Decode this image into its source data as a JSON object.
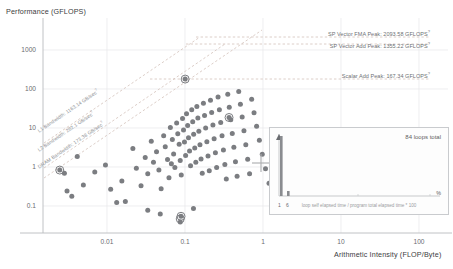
{
  "axes": {
    "y_title": "Performance (GFLOPS)",
    "x_title": "Arithmetic Intensity (FLOP/Byte)",
    "y_ticks": [
      "1000",
      "100",
      "10",
      "1",
      "0.1"
    ],
    "x_ticks": [
      "0.01",
      "0.1",
      "1",
      "10",
      "100"
    ]
  },
  "rooflines": {
    "peaks": [
      {
        "label": "SP Vector FMA Peak: 2093.58 GFLOPS",
        "value": 2093.58,
        "unit": "GFLOPS",
        "sup": "?"
      },
      {
        "label": "SP Vector Add Peak: 1355.22 GFLOPS",
        "value": 1355.22,
        "unit": "GFLOPS",
        "sup": "?"
      },
      {
        "label": "Scalar Add Peak: 167.34 GFLOPS",
        "value": 167.34,
        "unit": "GFLOPS",
        "sup": "?"
      }
    ],
    "bandwidths": [
      {
        "label": "L1 Bandwidth: 1163.14 GB/sec",
        "value": 1163.14,
        "unit": "GB/sec",
        "sup": "?"
      },
      {
        "label": "L2 Bandwidth: 282.1 GB/sec",
        "value": 282.1,
        "unit": "GB/sec",
        "sup": "?"
      },
      {
        "label": "DRAM Bandwidth: 173.38 GB/sec",
        "value": 173.38,
        "unit": "GB/sec",
        "sup": "?"
      }
    ]
  },
  "inset": {
    "title": "84 loops total",
    "caption": "loop self elapsed time / program total elapsed time * 100",
    "tick_left": "1",
    "tick_right": "6",
    "pct_symbol": "%"
  },
  "cursor": {
    "marker": "crosshair"
  },
  "colors": {
    "dot": "#7b7d81",
    "dot_highlight": "#5a5c60",
    "roofline": "#c9b8b0",
    "grid": "#e4e5e7",
    "axis": "#b9bbbe",
    "text": "#55575b"
  },
  "chart_data": {
    "type": "scatter",
    "title": "",
    "xlabel": "Arithmetic Intensity (FLOP/Byte)",
    "ylabel": "Performance (GFLOPS)",
    "xscale": "log",
    "yscale": "log",
    "xlim": [
      0.004,
      160
    ],
    "ylim": [
      0.03,
      4000
    ],
    "grid": true,
    "legend": "none",
    "roof_lines": [
      {
        "name": "SP Vector FMA Peak",
        "type": "horizontal",
        "y": 2093.58
      },
      {
        "name": "SP Vector Add Peak",
        "type": "horizontal",
        "y": 1355.22
      },
      {
        "name": "Scalar Add Peak",
        "type": "horizontal",
        "y": 167.34
      },
      {
        "name": "L1 Bandwidth",
        "type": "slope",
        "bandwidth": 1163.14
      },
      {
        "name": "L2 Bandwidth",
        "type": "slope",
        "bandwidth": 282.1
      },
      {
        "name": "DRAM Bandwidth",
        "type": "slope",
        "bandwidth": 173.38
      }
    ],
    "points": [
      [
        0.0062,
        0.95
      ],
      [
        0.0075,
        0.3
      ],
      [
        0.0098,
        2.0
      ],
      [
        0.0115,
        0.42
      ],
      [
        0.0155,
        0.85
      ],
      [
        0.0205,
        1.25
      ],
      [
        0.0235,
        0.33
      ],
      [
        0.0275,
        0.16
      ],
      [
        0.0315,
        0.52
      ],
      [
        0.0345,
        0.17
      ],
      [
        0.042,
        3.1
      ],
      [
        0.046,
        1.05
      ],
      [
        0.052,
        0.4
      ],
      [
        0.058,
        1.9
      ],
      [
        0.062,
        0.78
      ],
      [
        0.068,
        4.6
      ],
      [
        0.072,
        1.45
      ],
      [
        0.078,
        2.6
      ],
      [
        0.083,
        0.95
      ],
      [
        0.088,
        0.34
      ],
      [
        0.094,
        6.2
      ],
      [
        0.098,
        3.4
      ],
      [
        0.104,
        1.7
      ],
      [
        0.108,
        0.62
      ],
      [
        0.112,
        9.8
      ],
      [
        0.118,
        5.1
      ],
      [
        0.122,
        2.3
      ],
      [
        0.126,
        1.1
      ],
      [
        0.132,
        12.5
      ],
      [
        0.136,
        7.0
      ],
      [
        0.141,
        3.9
      ],
      [
        0.145,
        1.6
      ],
      [
        0.149,
        0.72
      ],
      [
        0.154,
        16.0
      ],
      [
        0.158,
        8.6
      ],
      [
        0.162,
        4.4
      ],
      [
        0.167,
        2.1
      ],
      [
        0.171,
        21.0
      ],
      [
        0.176,
        11.0
      ],
      [
        0.18,
        5.6
      ],
      [
        0.185,
        2.7
      ],
      [
        0.19,
        1.2
      ],
      [
        0.196,
        26.0
      ],
      [
        0.201,
        13.5
      ],
      [
        0.206,
        6.8
      ],
      [
        0.212,
        3.2
      ],
      [
        0.218,
        1.45
      ],
      [
        0.224,
        31.0
      ],
      [
        0.23,
        16.5
      ],
      [
        0.236,
        8.0
      ],
      [
        0.243,
        3.8
      ],
      [
        0.25,
        1.75
      ],
      [
        0.258,
        0.8
      ],
      [
        0.266,
        37.0
      ],
      [
        0.274,
        19.0
      ],
      [
        0.282,
        9.5
      ],
      [
        0.291,
        4.5
      ],
      [
        0.3,
        2.05
      ],
      [
        0.31,
        0.92
      ],
      [
        0.32,
        44.0
      ],
      [
        0.33,
        22.5
      ],
      [
        0.341,
        11.2
      ],
      [
        0.352,
        5.3
      ],
      [
        0.364,
        2.45
      ],
      [
        0.376,
        1.1
      ],
      [
        0.39,
        52.0
      ],
      [
        0.404,
        26.0
      ],
      [
        0.418,
        13.0
      ],
      [
        0.433,
        6.2
      ],
      [
        0.449,
        2.85
      ],
      [
        0.466,
        1.28
      ],
      [
        0.484,
        0.58
      ],
      [
        0.503,
        61.0
      ],
      [
        0.523,
        30.0
      ],
      [
        0.544,
        15.0
      ],
      [
        0.566,
        7.1
      ],
      [
        0.59,
        3.3
      ],
      [
        0.615,
        1.5
      ],
      [
        0.642,
        0.68
      ],
      [
        0.67,
        71.0
      ],
      [
        0.7,
        35.0
      ],
      [
        0.733,
        17.5
      ],
      [
        0.768,
        8.2
      ],
      [
        0.806,
        3.8
      ],
      [
        0.847,
        1.72
      ],
      [
        0.89,
        0.78
      ],
      [
        0.94,
        46.0
      ],
      [
        1.0,
        22.0
      ],
      [
        1.07,
        10.5
      ],
      [
        1.15,
        4.9
      ],
      [
        1.24,
        2.25
      ],
      [
        1.35,
        1.02
      ],
      [
        1.48,
        0.46
      ],
      [
        1.65,
        0.21
      ],
      [
        2.1,
        0.33
      ],
      [
        0.165,
        140.0
      ],
      [
        0.52,
        17.0
      ],
      [
        0.115,
        1.35
      ],
      [
        0.145,
        0.055
      ],
      [
        0.148,
        0.075
      ],
      [
        0.007,
        0.8
      ],
      [
        0.0085,
        0.225
      ],
      [
        0.062,
        0.105
      ],
      [
        0.086,
        0.085
      ],
      [
        0.205,
        0.115
      ]
    ],
    "highlighted_points": [
      [
        0.165,
        140.0
      ],
      [
        0.52,
        17.0
      ],
      [
        0.0062,
        0.95
      ],
      [
        0.145,
        0.065
      ],
      [
        0.148,
        0.075
      ]
    ],
    "cursor_marker": {
      "x": 4.0,
      "y": 1.45
    },
    "inset_histogram": {
      "type": "bar",
      "title": "84 loops total",
      "xlabel": "loop self elapsed time / program total elapsed time * 100",
      "categories": [
        "1",
        "6"
      ],
      "values": [
        82,
        2
      ]
    }
  }
}
